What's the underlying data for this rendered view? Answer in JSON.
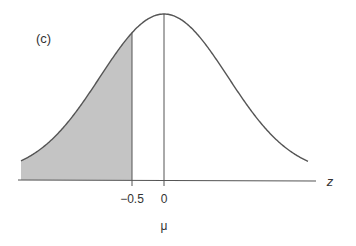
{
  "panel_label": "(c)",
  "axis": {
    "variable": "z",
    "ticks": [
      {
        "value": -0.5,
        "label": "−0.5"
      },
      {
        "value": 0,
        "label": "0"
      }
    ],
    "mean_label": "μ"
  },
  "colors": {
    "curve": "#555555",
    "shade": "#c4c4c4",
    "axis": "#555555"
  },
  "chart_data": {
    "type": "area",
    "title": "(c)",
    "xlabel": "z",
    "ylabel": "",
    "x_tick_labels": [
      "−0.5",
      "0"
    ],
    "x_tick_values": [
      -0.5,
      0
    ],
    "annotations": [
      "μ"
    ],
    "shaded_region": {
      "from": "-inf",
      "to": -0.5
    },
    "mean": 0,
    "vertical_lines": [
      -0.5,
      0
    ],
    "grid": false,
    "legend": null
  }
}
